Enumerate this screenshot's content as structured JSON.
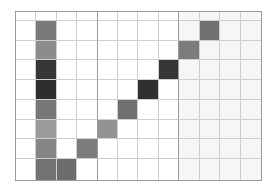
{
  "grid": {
    "columns": 12,
    "rows": 9,
    "row_heights": [
      9,
      20,
      20,
      20,
      20,
      20,
      20,
      20,
      21
    ],
    "major_lines_after_cols": [
      3,
      7
    ],
    "tinted_cols_from": 8,
    "colors": {
      "background": "#ffffff",
      "tint": "#f6f6f6",
      "line": "#cfcfcf",
      "major_line": "#9c9c9c"
    },
    "filled_cells": [
      {
        "row": 1,
        "col": 1,
        "color": "#7a7a7a"
      },
      {
        "row": 2,
        "col": 1,
        "color": "#8c8c8c"
      },
      {
        "row": 3,
        "col": 1,
        "color": "#363636"
      },
      {
        "row": 4,
        "col": 1,
        "color": "#2e2e2e"
      },
      {
        "row": 5,
        "col": 1,
        "color": "#777777"
      },
      {
        "row": 6,
        "col": 1,
        "color": "#9a9a9a"
      },
      {
        "row": 7,
        "col": 1,
        "color": "#858585"
      },
      {
        "row": 8,
        "col": 1,
        "color": "#727272"
      },
      {
        "row": 8,
        "col": 2,
        "color": "#6c6c6c"
      },
      {
        "row": 7,
        "col": 3,
        "color": "#7c7c7c"
      },
      {
        "row": 6,
        "col": 4,
        "color": "#939393"
      },
      {
        "row": 5,
        "col": 5,
        "color": "#707070"
      },
      {
        "row": 4,
        "col": 6,
        "color": "#303030"
      },
      {
        "row": 3,
        "col": 7,
        "color": "#363636"
      },
      {
        "row": 2,
        "col": 8,
        "color": "#7c7c7c"
      },
      {
        "row": 1,
        "col": 9,
        "color": "#707070"
      }
    ]
  }
}
